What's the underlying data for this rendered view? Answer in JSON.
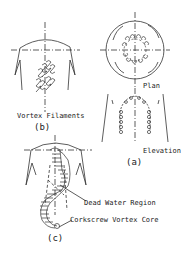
{
  "figure": {
    "panel_a": {
      "caption": "(a)",
      "plan_label": "Plan",
      "elevation_label": "Elevation"
    },
    "panel_b": {
      "caption": "(b)",
      "label": "Vortex Filaments"
    },
    "panel_c": {
      "caption": "(c)",
      "dead_water_label": "Dead Water Region",
      "vortex_core_label": "Corkscrew Vortex Core"
    }
  },
  "colors": {
    "line": "#333333",
    "background": "#ffffff"
  }
}
